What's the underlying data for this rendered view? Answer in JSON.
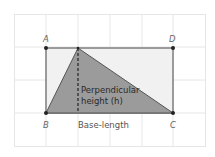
{
  "diagram": {
    "vertices": {
      "A": "A",
      "B": "B",
      "C": "C",
      "D": "D"
    },
    "labels": {
      "height_line1": "Perpendicular",
      "height_line2": "height (h)",
      "base": "Base-length"
    },
    "colors": {
      "grid": "#e6e6e6",
      "rectangle_fill": "#f1f1f1",
      "rectangle_stroke": "#444444",
      "triangle_fill": "#9b9b9b",
      "triangle_stroke": "#555555",
      "dashed_line": "#222222",
      "point": "#222222"
    }
  }
}
